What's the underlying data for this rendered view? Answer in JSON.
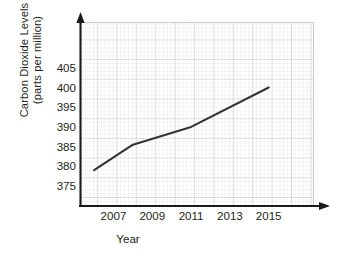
{
  "chart_data": {
    "type": "line",
    "title": "",
    "xlabel": "Year",
    "ylabel": "Carbon Dioxide Levels (parts per million)",
    "ylabel_line1": "Carbon Dioxide Levels",
    "ylabel_line2": "(parts per million)",
    "xticks": [
      2007,
      2009,
      2011,
      2013,
      2015
    ],
    "xtick_labels": [
      "2007",
      "2009",
      "2011",
      "2013",
      "2015"
    ],
    "yticks": [
      375,
      380,
      385,
      390,
      395,
      400,
      405
    ],
    "ytick_labels": [
      "375",
      "380",
      "385",
      "390",
      "395",
      "400",
      "405"
    ],
    "xlim": [
      2006,
      2018
    ],
    "ylim": [
      372,
      412
    ],
    "grid": true,
    "grid_minor": true,
    "legend": "none",
    "series": [
      {
        "name": "Carbon dioxide levels",
        "color": "#333333",
        "x": [
          2006,
          2008,
          2011,
          2015
        ],
        "values": [
          379,
          385.5,
          390,
          400
        ]
      }
    ]
  },
  "style": {
    "axis_color": "#1a1a1a",
    "line_color": "#333333",
    "grid_major_color": "#c9c9c9",
    "grid_minor_color": "#ebebeb",
    "background": "#ffffff",
    "text_color": "#231f20"
  },
  "icons": {
    "y_axis_arrow": "arrow-up-icon",
    "x_axis_arrow": "arrow-right-icon"
  }
}
